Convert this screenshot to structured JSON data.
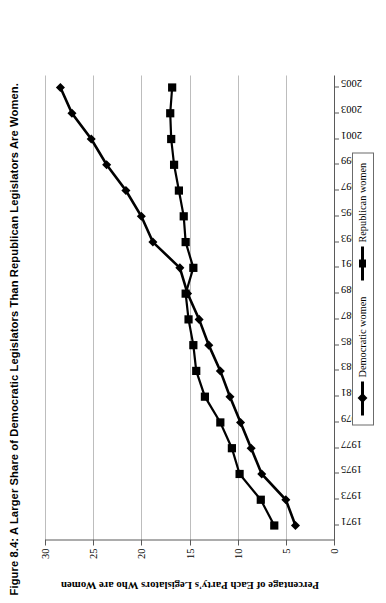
{
  "figure": {
    "title": "Figure 8.4: A Larger Share of Democratic Legislators Than Republican Legislators Are Women.",
    "orientation_note": "rotated-90-ccw"
  },
  "legend": {
    "position": "bottom-center",
    "entries": [
      {
        "label": "Democratic women",
        "marker": "diamond-marker",
        "color": "#000000"
      },
      {
        "label": "Republican women",
        "marker": "square-marker",
        "color": "#000000"
      }
    ]
  },
  "chart_data": {
    "type": "line",
    "title": "Figure 8.4: A Larger Share of Democratic Legislators Than Republican Legislators Are Women.",
    "xlabel": "",
    "ylabel": "Percentage of Each Party's Legislators Who are Women",
    "x": [
      1971,
      1973,
      1975,
      1977,
      1979,
      1981,
      1983,
      1985,
      1987,
      1989,
      1991,
      1993,
      1995,
      1997,
      1999,
      2001,
      2003,
      2005
    ],
    "xtick_labels": [
      "1971",
      "1973",
      "1975",
      "1977",
      "1979",
      "1981",
      "1983",
      "1985",
      "1987",
      "1989",
      "1991",
      "1993",
      "1995",
      "1997",
      "1999",
      "2001",
      "2003",
      "2005"
    ],
    "ytick_labels": [
      "0",
      "5",
      "10",
      "15",
      "20",
      "25",
      "30"
    ],
    "yticks": [
      0,
      5,
      10,
      15,
      20,
      25,
      30
    ],
    "ylim": [
      0,
      30
    ],
    "xlim": [
      1970,
      2006
    ],
    "grid": "horizontal-value-gridlines",
    "legend_position": "bottom-center",
    "series": [
      {
        "name": "Democratic women",
        "marker": "diamond",
        "values": [
          4.0,
          5.0,
          7.5,
          8.6,
          9.7,
          10.8,
          11.8,
          13.0,
          14.0,
          15.2,
          16.0,
          18.8,
          20.0,
          21.6,
          23.6,
          25.2,
          27.2,
          28.4
        ]
      },
      {
        "name": "Republican women",
        "marker": "square",
        "values": [
          6.2,
          7.6,
          9.8,
          10.6,
          11.8,
          13.4,
          14.3,
          14.6,
          15.1,
          15.4,
          14.6,
          15.4,
          15.6,
          16.1,
          16.6,
          16.9,
          17.0,
          16.8
        ]
      }
    ]
  },
  "axes": {
    "y_title": "Percentage of Each Party's Legislators Who are Women"
  }
}
